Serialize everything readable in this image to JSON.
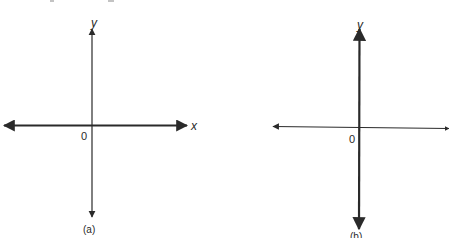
{
  "figure": {
    "top_fragment": "(a       b)",
    "panels": [
      {
        "id": "a",
        "caption": "(a)",
        "origin_label": "0",
        "x_axis_label": "x",
        "y_axis_label": "y",
        "description": "Standard axes: x-axis with arrows at both ends, y-axis with arrows at both ends; horizontal axis emphasized"
      },
      {
        "id": "b",
        "caption": "(b)",
        "origin_label": "0",
        "x_axis_label": "",
        "y_axis_label": "y",
        "description": "Axes with y-axis emphasized (thicker vertical line), x-axis thinner"
      }
    ],
    "colors": {
      "ink": "#2a2a2a",
      "background": "#ffffff"
    }
  }
}
